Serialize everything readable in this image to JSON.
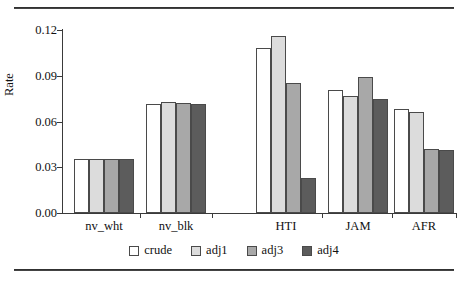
{
  "chart_data": {
    "type": "bar",
    "title": "",
    "xlabel": "",
    "ylabel": "Rate",
    "ylim": [
      0.0,
      0.12
    ],
    "yticks": [
      "0.00",
      "0.03",
      "0.06",
      "0.09",
      "0.12"
    ],
    "ytick_values": [
      0.0,
      0.03,
      0.06,
      0.09,
      0.12
    ],
    "grid": false,
    "legend_position": "bottom-center",
    "categories": [
      "nv_wht",
      "nv_blk",
      "HTI",
      "JAM",
      "AFR"
    ],
    "series": [
      {
        "name": "crude",
        "color": "#ffffff",
        "values": [
          0.0354,
          0.0715,
          0.108,
          0.0805,
          0.0685
        ]
      },
      {
        "name": "adj1",
        "color": "#dcdcdc",
        "values": [
          0.0354,
          0.0725,
          0.116,
          0.0765,
          0.066
        ]
      },
      {
        "name": "adj3",
        "color": "#a8a8a8",
        "values": [
          0.0354,
          0.072,
          0.0855,
          0.089,
          0.042
        ]
      },
      {
        "name": "adj4",
        "color": "#5c5c5c",
        "values": [
          0.0354,
          0.0715,
          0.023,
          0.075,
          0.041
        ]
      }
    ]
  },
  "legend": {
    "items": [
      {
        "label": "crude"
      },
      {
        "label": "adj1"
      },
      {
        "label": "adj3"
      },
      {
        "label": "adj4"
      }
    ]
  }
}
